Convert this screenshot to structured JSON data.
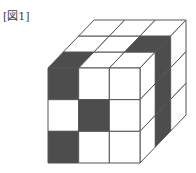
{
  "figure": {
    "label": "[図1]",
    "colors": {
      "dark": "#4d4d4d",
      "light": "#ffffff",
      "line": "#555555"
    },
    "grid_size": 3,
    "front_face": {
      "origin": [
        48,
        68
      ],
      "width": 92,
      "height": 95,
      "cells": [
        [
          "dark",
          "light",
          "light"
        ],
        [
          "light",
          "dark",
          "light"
        ],
        [
          "dark",
          "light",
          "light"
        ]
      ]
    },
    "depth_offset": [
      46,
      -48
    ],
    "top_face": {
      "cells_by_depth_front_to_back": [
        [
          "dark",
          "light",
          "light"
        ],
        [
          "light",
          "light",
          "dark"
        ],
        [
          "light",
          "light",
          "light"
        ]
      ]
    },
    "right_face": {
      "cells_by_row_top_to_bottom": [
        [
          "light",
          "dark",
          "light"
        ],
        [
          "light",
          "dark",
          "light"
        ],
        [
          "light",
          "dark",
          "light"
        ]
      ]
    }
  }
}
